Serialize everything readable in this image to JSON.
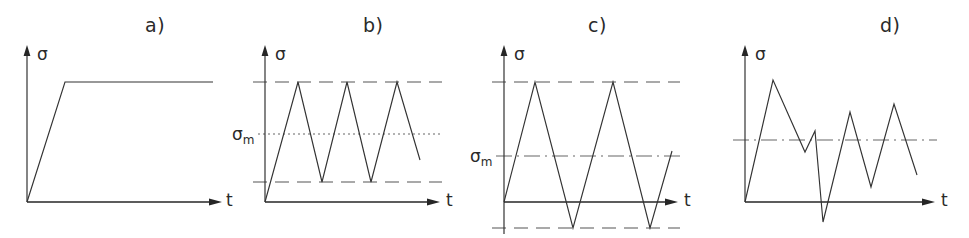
{
  "figure": {
    "width": 969,
    "height": 238,
    "background": "#ffffff",
    "stroke_color": "#333333"
  },
  "panels": [
    {
      "id": "a",
      "label": "a)",
      "label_pos": {
        "x": 145,
        "y": 14
      },
      "description": "Static constant stress: linear ramp up then constant plateau",
      "y_axis_label": "σ",
      "x_axis_label": "t",
      "origin": {
        "x": 27,
        "y": 202
      },
      "y_axis_top": 45,
      "x_axis_end": 222,
      "y_axis_label_pos": {
        "x": 37,
        "y": 44
      },
      "x_axis_label_pos": {
        "x": 226,
        "y": 190
      },
      "reference_lines": [],
      "mean_label": null,
      "curve_points": [
        {
          "x": 27,
          "y": 202
        },
        {
          "x": 65,
          "y": 82
        },
        {
          "x": 213,
          "y": 82
        }
      ]
    },
    {
      "id": "b",
      "label": "b)",
      "label_pos": {
        "x": 363,
        "y": 14
      },
      "description": "Repeated (pulsating) tension cycle, all stress positive, mean stress above zero",
      "y_axis_label": "σ",
      "x_axis_label": "t",
      "origin": {
        "x": 265,
        "y": 202
      },
      "y_axis_top": 45,
      "x_axis_end": 440,
      "y_axis_label_pos": {
        "x": 275,
        "y": 44
      },
      "x_axis_label_pos": {
        "x": 446,
        "y": 190
      },
      "reference_lines": [
        {
          "name": "max-stress-line",
          "style": "dashed",
          "y": 82,
          "x1": 253,
          "x2": 442
        },
        {
          "name": "mean-stress-line",
          "style": "dotted",
          "y": 134,
          "x1": 258,
          "x2": 442
        },
        {
          "name": "min-stress-line",
          "style": "dashed",
          "y": 182,
          "x1": 253,
          "x2": 442
        }
      ],
      "mean_label": {
        "text": "σ",
        "sub": "m",
        "x": 232,
        "y": 124
      },
      "curve_points": [
        {
          "x": 265,
          "y": 202
        },
        {
          "x": 298,
          "y": 82
        },
        {
          "x": 322,
          "y": 182
        },
        {
          "x": 347,
          "y": 82
        },
        {
          "x": 371,
          "y": 182
        },
        {
          "x": 397,
          "y": 82
        },
        {
          "x": 420,
          "y": 160
        }
      ]
    },
    {
      "id": "c",
      "label": "c)",
      "label_pos": {
        "x": 588,
        "y": 14
      },
      "description": "Fully reversed (alternating) cycle, stress swings above and below the time axis",
      "y_axis_label": "σ",
      "x_axis_label": "t",
      "origin": {
        "x": 504,
        "y": 202
      },
      "y_axis_top": 45,
      "y_axis_bottom": 234,
      "x_axis_end": 678,
      "y_axis_label_pos": {
        "x": 514,
        "y": 44
      },
      "x_axis_label_pos": {
        "x": 684,
        "y": 190
      },
      "reference_lines": [
        {
          "name": "max-stress-line",
          "style": "dashed",
          "y": 82,
          "x1": 492,
          "x2": 680
        },
        {
          "name": "mean-stress-line",
          "style": "dashdot",
          "y": 156,
          "x1": 496,
          "x2": 680
        },
        {
          "name": "min-stress-line",
          "style": "dashed",
          "y": 228,
          "x1": 492,
          "x2": 680
        }
      ],
      "mean_label": {
        "text": "σ",
        "sub": "m",
        "x": 470,
        "y": 146
      },
      "curve_points": [
        {
          "x": 504,
          "y": 202
        },
        {
          "x": 535,
          "y": 82
        },
        {
          "x": 573,
          "y": 228
        },
        {
          "x": 613,
          "y": 82
        },
        {
          "x": 650,
          "y": 228
        },
        {
          "x": 672,
          "y": 151
        }
      ]
    },
    {
      "id": "d",
      "label": "d)",
      "label_pos": {
        "x": 880,
        "y": 14
      },
      "description": "Random / irregular variable-amplitude stress history",
      "y_axis_label": "σ",
      "x_axis_label": "t",
      "origin": {
        "x": 745,
        "y": 202
      },
      "y_axis_top": 45,
      "x_axis_end": 935,
      "y_axis_label_pos": {
        "x": 755,
        "y": 44
      },
      "x_axis_label_pos": {
        "x": 941,
        "y": 190
      },
      "reference_lines": [
        {
          "name": "mean-stress-line",
          "style": "dashdot",
          "y": 140,
          "x1": 733,
          "x2": 937
        }
      ],
      "mean_label": null,
      "curve_points": [
        {
          "x": 745,
          "y": 202
        },
        {
          "x": 773,
          "y": 80
        },
        {
          "x": 805,
          "y": 152
        },
        {
          "x": 815,
          "y": 131
        },
        {
          "x": 823,
          "y": 222
        },
        {
          "x": 850,
          "y": 112
        },
        {
          "x": 871,
          "y": 187
        },
        {
          "x": 894,
          "y": 104
        },
        {
          "x": 917,
          "y": 175
        }
      ]
    }
  ]
}
